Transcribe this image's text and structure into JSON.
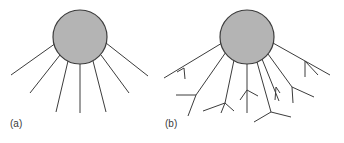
{
  "figure": {
    "colors": {
      "circle_fill": "#b4b4b4",
      "stroke": "#3c3c3c",
      "label": "#3a3a3a"
    },
    "panels": [
      {
        "id": "a",
        "label": "(a)",
        "circle": {
          "cx": 80,
          "cy": 37,
          "r": 27
        },
        "lines": [
          [
            56,
            43,
            11,
            75
          ],
          [
            60,
            55,
            30,
            93
          ],
          [
            68,
            61,
            56,
            112
          ],
          [
            80,
            64,
            80,
            113
          ],
          [
            93,
            61,
            106,
            112
          ],
          [
            101,
            55,
            129,
            93
          ],
          [
            106,
            43,
            148,
            76
          ]
        ]
      },
      {
        "id": "b",
        "label": "(b)",
        "circle": {
          "cx": 247,
          "cy": 37,
          "r": 27
        },
        "lines": [
          [
            222,
            43,
            164,
            78
          ],
          [
            184,
            68,
            185,
            79
          ],
          [
            184,
            68,
            177,
            72
          ],
          [
            226,
            52,
            196,
            95
          ],
          [
            196,
            95,
            188,
            116
          ],
          [
            196,
            95,
            176,
            95
          ],
          [
            234,
            60,
            225,
            103
          ],
          [
            225,
            103,
            203,
            111
          ],
          [
            225,
            103,
            221,
            113
          ],
          [
            225,
            103,
            234,
            111
          ],
          [
            247,
            64,
            247,
            113
          ],
          [
            247,
            90,
            240,
            100
          ],
          [
            247,
            90,
            258,
            96
          ],
          [
            257,
            62,
            271,
            112
          ],
          [
            271,
            112,
            254,
            122
          ],
          [
            271,
            112,
            291,
            117
          ],
          [
            262,
            59,
            279,
            101
          ],
          [
            276,
            87,
            275,
            100
          ],
          [
            276,
            87,
            280,
            93
          ],
          [
            268,
            54,
            292,
            87
          ],
          [
            292,
            87,
            293,
            103
          ],
          [
            292,
            87,
            314,
            97
          ],
          [
            273,
            43,
            330,
            75
          ],
          [
            305,
            61,
            305,
            77
          ],
          [
            305,
            61,
            318,
            75
          ]
        ]
      }
    ]
  }
}
